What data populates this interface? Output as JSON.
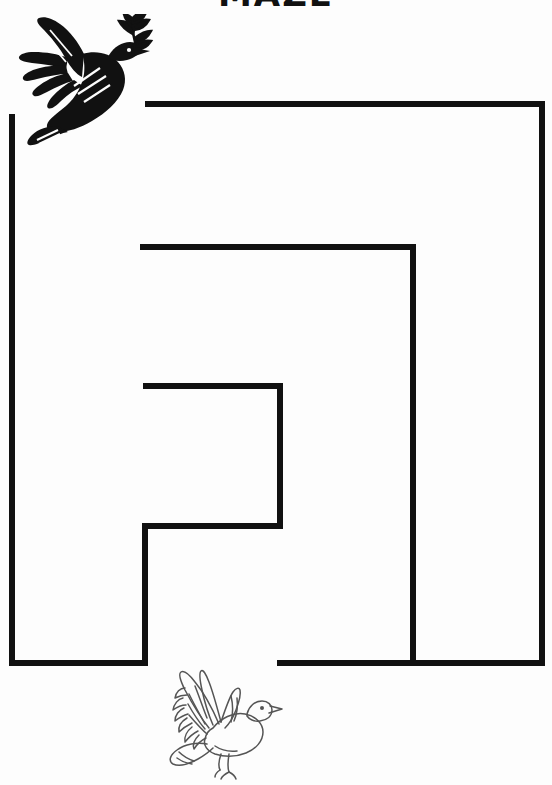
{
  "page": {
    "kind": "printable-maze-worksheet",
    "width": 552,
    "height": 785,
    "background_color": "#fdfdfd",
    "ink_color": "#111111",
    "title": "MAZE",
    "title_note": "title is cropped off the top edge; only the lower fragments of the bold letters are visible"
  },
  "maze": {
    "wall_color": "#111111",
    "wall_thickness": 6,
    "entrance_label": "entrance-gap-top-left",
    "exit_label": "exit-gap-bottom-center",
    "walls": [
      {
        "name": "outer-left-wall",
        "x1": 12,
        "y1": 114,
        "x2": 12,
        "y2": 663
      },
      {
        "name": "outer-bottom-left-wall",
        "x1": 12,
        "y1": 663,
        "x2": 148,
        "y2": 663
      },
      {
        "name": "outer-top-wall",
        "x1": 145,
        "y1": 104,
        "x2": 542,
        "y2": 104
      },
      {
        "name": "outer-right-wall",
        "x1": 542,
        "y1": 104,
        "x2": 542,
        "y2": 663
      },
      {
        "name": "outer-bottom-right-wall",
        "x1": 277,
        "y1": 663,
        "x2": 542,
        "y2": 663
      },
      {
        "name": "inner-upper-horizontal-wall",
        "x1": 140,
        "y1": 247,
        "x2": 413,
        "y2": 247
      },
      {
        "name": "inner-vertical-wall",
        "x1": 413,
        "y1": 247,
        "x2": 413,
        "y2": 663
      },
      {
        "name": "inner-core-top-wall",
        "x1": 143,
        "y1": 386,
        "x2": 280,
        "y2": 386
      },
      {
        "name": "inner-core-right-wall",
        "x1": 280,
        "y1": 386,
        "x2": 280,
        "y2": 526
      },
      {
        "name": "inner-core-bottom-wall",
        "x1": 145,
        "y1": 526,
        "x2": 280,
        "y2": 526
      },
      {
        "name": "inner-core-left-wall",
        "x1": 145,
        "y1": 526,
        "x2": 145,
        "y2": 663
      }
    ]
  },
  "illustrations": {
    "top": {
      "name": "peace-dove-silhouette",
      "style": "solid black silhouette",
      "description": "flying dove carrying an olive branch in its beak",
      "color": "#111111"
    },
    "bottom": {
      "name": "dove-line-art",
      "style": "pencil outline drawing",
      "description": "flying dove with raised wings facing right",
      "color": "#555555"
    }
  }
}
